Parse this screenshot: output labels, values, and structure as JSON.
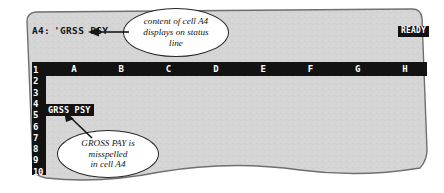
{
  "app": {
    "kind": "spreadsheet-screenshot-illustration",
    "mode_indicator": "READY"
  },
  "status_line": {
    "cell_reference": "A4:",
    "cell_contents": "'GRSS PSY"
  },
  "grid": {
    "column_headers": [
      "A",
      "B",
      "C",
      "D",
      "E",
      "F",
      "G",
      "H"
    ],
    "row_headers": [
      "1",
      "2",
      "3",
      "4",
      "5",
      "6",
      "7",
      "8",
      "9",
      "10"
    ],
    "selected_cell": {
      "address": "A4",
      "display_text": "GRSS PSY"
    }
  },
  "callouts": [
    {
      "id": "status-callout",
      "lines": [
        "content of cell A4",
        "displays on status",
        "line"
      ],
      "points_to": "status_line"
    },
    {
      "id": "cell-callout",
      "lines": [
        "GROSS PAY is",
        "misspelled",
        "in cell A4"
      ],
      "points_to": "cell A4"
    }
  ],
  "colors": {
    "screen_fill": "#d5d5d5",
    "screen_border": "#6f6f6f",
    "bar_black": "#121212",
    "text_white": "#ffffff",
    "page_background": "#ffffff",
    "callout_outline": "#262626"
  }
}
